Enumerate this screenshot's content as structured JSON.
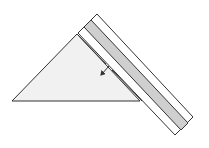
{
  "diagram": {
    "colors": {
      "background": "#ffffff",
      "triangle_fill": "#f1f1f1",
      "stroke": "#333333",
      "band_fill": "#ffffff",
      "stripe_fill": "#cfcfcf"
    },
    "triangle": {
      "points": [
        [
          12,
          101
        ],
        [
          77,
          34
        ],
        [
          140,
          101
        ]
      ]
    },
    "band": {
      "outer": [
        [
          97,
          14
        ],
        [
          193,
          117
        ],
        [
          175,
          135
        ],
        [
          78,
          33
        ]
      ],
      "stripe": [
        [
          91,
          20
        ],
        [
          188,
          123
        ],
        [
          181,
          130
        ],
        [
          84,
          27
        ]
      ]
    },
    "inner_line": {
      "segments": [
        [
          [
            78,
            35
          ],
          [
            106,
            64
          ]
        ],
        [
          [
            112,
            70
          ],
          [
            142,
            101
          ]
        ]
      ]
    },
    "arrow": {
      "from": [
        109,
        66
      ],
      "to": [
        101,
        75
      ],
      "direction": "down-left"
    }
  }
}
